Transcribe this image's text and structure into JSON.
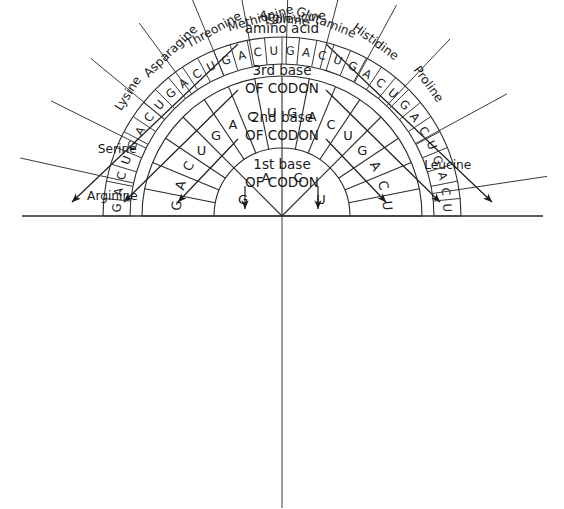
{
  "diagram": {
    "geometry": {
      "cx": 282,
      "cy": 216,
      "r_inner_0": 0,
      "r_ring1_out": 68,
      "r_ring2_out": 140,
      "r_ring3_in": 152,
      "r_ring3_out": 179,
      "r_label": 196,
      "baseline_x1": 22,
      "baseline_x2": 543,
      "baseline_y": 216
    },
    "colors": {
      "ink": "#1a1a1a",
      "line": "#2b2b2b",
      "background": "#ffffff"
    }
  },
  "headers": [
    {
      "line1": "amino acid",
      "line2": "",
      "x": 282,
      "y": 33
    },
    {
      "line1": "3rd base",
      "line2": "OF CODON",
      "x": 282,
      "y": 75
    },
    {
      "line1": "2nd base",
      "line2": "OF CODON",
      "x": 282,
      "y": 122
    },
    {
      "line1": "1st base",
      "line2": "OF CODON",
      "x": 282,
      "y": 169
    }
  ],
  "arrows": [
    {
      "name": "arrow-amino-acid-left",
      "x1": 238,
      "y1": 44,
      "x2": 72,
      "y2": 202
    },
    {
      "name": "arrow-3rd-base-left",
      "x1": 238,
      "y1": 90,
      "x2": 124,
      "y2": 202
    },
    {
      "name": "arrow-2nd-base-left",
      "x1": 238,
      "y1": 139,
      "x2": 178,
      "y2": 202
    },
    {
      "name": "arrow-1st-base-left",
      "x1": 245,
      "y1": 186,
      "x2": 245,
      "y2": 209
    },
    {
      "name": "arrow-1st-base-right",
      "x1": 318,
      "y1": 186,
      "x2": 318,
      "y2": 209
    },
    {
      "name": "arrow-2nd-base-right",
      "x1": 326,
      "y1": 139,
      "x2": 386,
      "y2": 202
    },
    {
      "name": "arrow-3rd-base-right",
      "x1": 326,
      "y1": 90,
      "x2": 440,
      "y2": 202
    },
    {
      "name": "arrow-amino-acid-right",
      "x1": 326,
      "y1": 44,
      "x2": 492,
      "y2": 202
    }
  ],
  "ring1": {
    "label": "1st base of codon",
    "segments": [
      {
        "letter": "G",
        "a0": 180,
        "a1": 135
      },
      {
        "letter": "A",
        "a0": 135,
        "a1": 90
      },
      {
        "letter": "C",
        "a0": 90,
        "a1": 45
      },
      {
        "letter": "U",
        "a0": 45,
        "a1": 0
      }
    ]
  },
  "ring2": {
    "label": "2nd base of codon",
    "segments": [
      {
        "letter": "G",
        "a0": 180,
        "a1": 168.75
      },
      {
        "letter": "A",
        "a0": 168.75,
        "a1": 157.5
      },
      {
        "letter": "C",
        "a0": 157.5,
        "a1": 146.25
      },
      {
        "letter": "U",
        "a0": 146.25,
        "a1": 135
      },
      {
        "letter": "G",
        "a0": 135,
        "a1": 123.75
      },
      {
        "letter": "A",
        "a0": 123.75,
        "a1": 112.5
      },
      {
        "letter": "C",
        "a0": 112.5,
        "a1": 101.25
      },
      {
        "letter": "U",
        "a0": 101.25,
        "a1": 90
      },
      {
        "letter": "G",
        "a0": 90,
        "a1": 78.75
      },
      {
        "letter": "A",
        "a0": 78.75,
        "a1": 67.5
      },
      {
        "letter": "C",
        "a0": 67.5,
        "a1": 56.25
      },
      {
        "letter": "U",
        "a0": 56.25,
        "a1": 45
      },
      {
        "letter": "G",
        "a0": 45,
        "a1": 33.75
      },
      {
        "letter": "A",
        "a0": 33.75,
        "a1": 22.5
      },
      {
        "letter": "C",
        "a0": 22.5,
        "a1": 11.25
      },
      {
        "letter": "U",
        "a0": 11.25,
        "a1": 0
      }
    ],
    "visible_letters": [
      "G",
      "A",
      "C",
      "U",
      "G",
      "A",
      "C",
      "U"
    ]
  },
  "ring3": {
    "label": "3rd base of codon",
    "letters": [
      "G",
      "A",
      "C",
      "U",
      "G",
      "A",
      "C",
      "U",
      "G",
      "A",
      "C",
      "U",
      "G",
      "A",
      "C",
      "U",
      "G",
      "A",
      "C",
      "U",
      "G",
      "A",
      "C",
      "U",
      "G",
      "A",
      "C",
      "U",
      "G",
      "A",
      "C",
      "U"
    ]
  },
  "amino_acids": [
    {
      "name": "Arginine",
      "angle": 174,
      "align": "start",
      "rotate": false
    },
    {
      "name": "Serine",
      "angle": 160,
      "align": "start",
      "rotate": false
    },
    {
      "name": "Lysine",
      "angle": 147,
      "align": "start",
      "rotate": true
    },
    {
      "name": "Asparagine",
      "angle": 134,
      "align": "start",
      "rotate": true
    },
    {
      "name": "Threonine",
      "angle": 119,
      "align": "start",
      "rotate": true
    },
    {
      "name": "Methionine",
      "angle": 106,
      "align": "start",
      "rotate": true
    },
    {
      "name": "Isoleucine",
      "angle": 95,
      "align": "start",
      "rotate": true
    },
    {
      "name": "Arginine",
      "angle": 82,
      "align": "end",
      "rotate": true
    },
    {
      "name": "Glutamine",
      "angle": 68,
      "align": "end",
      "rotate": true
    },
    {
      "name": "Histidine",
      "angle": 54,
      "align": "end",
      "rotate": true
    },
    {
      "name": "Proline",
      "angle": 36,
      "align": "end",
      "rotate": true
    },
    {
      "name": "Leucine",
      "angle": 15,
      "align": "end",
      "rotate": false
    }
  ],
  "leader_lines": [
    {
      "angle": 167.5,
      "r1": 152,
      "r2": 268
    },
    {
      "angle": 153.5,
      "r1": 152,
      "r2": 258
    },
    {
      "angle": 140.5,
      "r1": 152,
      "r2": 248
    },
    {
      "angle": 126.5,
      "r1": 152,
      "r2": 240
    },
    {
      "angle": 112.5,
      "r1": 152,
      "r2": 238
    },
    {
      "angle": 100.5,
      "r1": 152,
      "r2": 250
    },
    {
      "angle": 88.5,
      "r1": 152,
      "r2": 282
    },
    {
      "angle": 75.5,
      "r1": 152,
      "r2": 250
    },
    {
      "angle": 61.5,
      "r1": 152,
      "r2": 240
    },
    {
      "angle": 46.5,
      "r1": 152,
      "r2": 244
    },
    {
      "angle": 28.5,
      "r1": 152,
      "r2": 256
    },
    {
      "angle": 8.5,
      "r1": 152,
      "r2": 268
    }
  ]
}
